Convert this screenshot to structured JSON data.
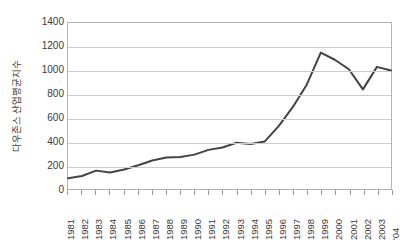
{
  "chart_data": {
    "type": "line",
    "title": "",
    "xlabel": "",
    "ylabel": "다우존스 산업평균지수",
    "categories": [
      "1981",
      "1982",
      "1983",
      "1984",
      "1985",
      "1986",
      "1987",
      "1988",
      "1989",
      "1990",
      "1991",
      "1992",
      "1993",
      "1994",
      "1995",
      "1996",
      "1997",
      "1998",
      "1999",
      "2000",
      "2001",
      "2002",
      "2003",
      "'04"
    ],
    "values": [
      90,
      110,
      155,
      140,
      165,
      200,
      240,
      265,
      270,
      290,
      330,
      350,
      390,
      380,
      400,
      530,
      690,
      880,
      1150,
      1090,
      1010,
      840,
      1030,
      1000
    ],
    "series": [
      {
        "name": "다우존스 산업평균지수",
        "values": [
          90,
          110,
          155,
          140,
          165,
          200,
          240,
          265,
          270,
          290,
          330,
          350,
          390,
          380,
          400,
          530,
          690,
          880,
          1150,
          1090,
          1010,
          840,
          1030,
          1000
        ]
      }
    ],
    "ylim": [
      0,
      1400
    ],
    "yticks": [
      0,
      200,
      400,
      600,
      800,
      1000,
      1200,
      1400
    ],
    "ytick_labels": [
      "0",
      "200",
      "400",
      "600",
      "800",
      "1000",
      "1200",
      "1400"
    ],
    "grid": "horizontal",
    "legend": "none",
    "line_color": "#444444",
    "grid_color": "#cccccc",
    "axis_color": "#b3b3b3",
    "text_color": "#3a3a3a",
    "background": "#ffffff"
  }
}
